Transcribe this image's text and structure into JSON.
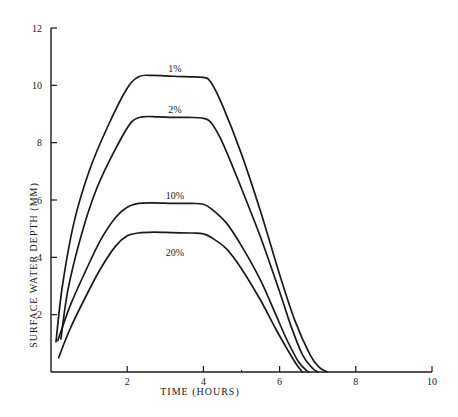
{
  "chart_data": {
    "type": "line",
    "title": "",
    "xlabel": "TIME (HOURS)",
    "ylabel": "SURFACE WATER DEPTH (MM)",
    "xlim": [
      0,
      10
    ],
    "ylim": [
      0,
      12
    ],
    "xticks": [
      2,
      4,
      6,
      8,
      10
    ],
    "yticks": [
      2,
      4,
      6,
      8,
      10,
      12
    ],
    "grid": false,
    "legend": "inline labels above each curve plateau",
    "series": [
      {
        "name": "1%",
        "x": [
          0.13,
          0.3,
          0.6,
          1.0,
          1.5,
          2.0,
          2.3,
          2.6,
          3.0,
          3.5,
          4.0,
          4.2,
          4.5,
          5.0,
          5.5,
          6.0,
          6.4,
          6.8,
          7.05,
          7.25
        ],
        "y": [
          1.05,
          3.0,
          5.2,
          7.0,
          8.6,
          9.9,
          10.3,
          10.35,
          10.33,
          10.3,
          10.28,
          10.1,
          9.3,
          7.6,
          5.6,
          3.4,
          1.8,
          0.6,
          0.15,
          0.0
        ]
      },
      {
        "name": "2%",
        "x": [
          0.26,
          0.45,
          0.8,
          1.2,
          1.7,
          2.1,
          2.4,
          2.8,
          3.2,
          3.6,
          4.0,
          4.2,
          4.5,
          5.0,
          5.5,
          6.0,
          6.3,
          6.6,
          6.85,
          7.0
        ],
        "y": [
          1.15,
          2.9,
          4.8,
          6.4,
          7.8,
          8.7,
          8.9,
          8.9,
          8.88,
          8.88,
          8.85,
          8.7,
          8.0,
          6.4,
          4.7,
          2.8,
          1.6,
          0.6,
          0.15,
          0.0
        ]
      },
      {
        "name": "10%",
        "x": [
          0.18,
          0.5,
          0.9,
          1.3,
          1.7,
          2.0,
          2.3,
          2.7,
          3.2,
          3.7,
          4.0,
          4.2,
          4.6,
          5.0,
          5.5,
          5.9,
          6.2,
          6.5,
          6.75
        ],
        "y": [
          1.1,
          2.3,
          3.5,
          4.6,
          5.4,
          5.75,
          5.88,
          5.9,
          5.88,
          5.88,
          5.85,
          5.7,
          5.2,
          4.4,
          3.2,
          2.0,
          1.1,
          0.35,
          0.0
        ]
      },
      {
        "name": "20%",
        "x": [
          0.2,
          0.5,
          0.9,
          1.3,
          1.7,
          2.0,
          2.3,
          2.7,
          3.2,
          3.7,
          4.0,
          4.2,
          4.6,
          5.0,
          5.5,
          5.9,
          6.2,
          6.45,
          6.6
        ],
        "y": [
          0.5,
          1.5,
          2.6,
          3.6,
          4.4,
          4.75,
          4.85,
          4.88,
          4.86,
          4.85,
          4.82,
          4.7,
          4.3,
          3.6,
          2.5,
          1.5,
          0.8,
          0.25,
          0.0
        ]
      }
    ],
    "annotations": [
      {
        "text": "1%",
        "x": 3.2,
        "y": 10.55
      },
      {
        "text": "2%",
        "x": 3.2,
        "y": 9.1
      },
      {
        "text": "10%",
        "x": 3.2,
        "y": 6.1
      },
      {
        "text": "20%",
        "x": 3.2,
        "y": 4.1
      }
    ]
  },
  "axes": {
    "x_tick_labels": [
      "2",
      "4",
      "6",
      "8",
      "10"
    ],
    "y_tick_labels": [
      "2",
      "4",
      "6",
      "8",
      "10",
      "12"
    ],
    "x_title": "TIME (HOURS)",
    "y_title": "SURFACE WATER DEPTH (MM)"
  }
}
